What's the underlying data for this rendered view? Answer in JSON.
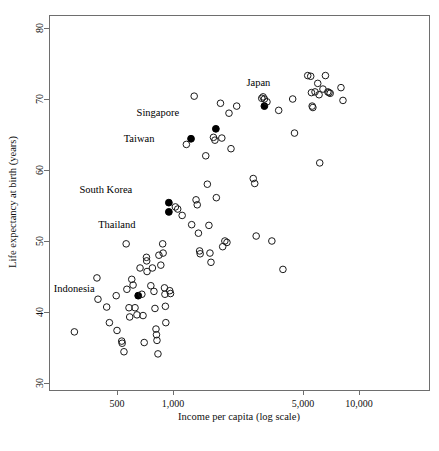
{
  "chart_data": {
    "type": "scatter",
    "title": "",
    "xlabel": "Income per capita (log scale)",
    "ylabel": "Life expectancy at birth (years)",
    "xscale": "log",
    "yscale": "linear",
    "xlim": [
      230,
      26000
    ],
    "ylim": [
      29,
      82
    ],
    "xticks": [
      500,
      1000,
      5000,
      10000
    ],
    "xtick_labels": [
      "500",
      "1,000",
      "5,000",
      "10,000"
    ],
    "yticks": [
      30,
      40,
      50,
      60,
      70,
      80
    ],
    "ytick_labels": [
      "30",
      "40",
      "50",
      "60",
      "70",
      "80"
    ],
    "grid": false,
    "legend": false,
    "marker_open": "open-circle",
    "marker_highlight": "filled-circle",
    "series": [
      {
        "name": "Highlighted countries",
        "marker": "filled-circle",
        "points": [
          {
            "label": "Japan",
            "x": 3100,
            "y": 69.0,
            "label_dx": -6,
            "label_dy": -20
          },
          {
            "label": "Singapore",
            "x": 1700,
            "y": 65.8,
            "label_dx": -58,
            "label_dy": -13
          },
          {
            "label": "Taiwan",
            "x": 1250,
            "y": 64.4,
            "label_dx": -52,
            "label_dy": 3
          },
          {
            "label": "South Korea",
            "x": 950,
            "y": 55.4,
            "label_dx": -63,
            "label_dy": -10
          },
          {
            "label": "Thailand",
            "x": 950,
            "y": 54.1,
            "label_dx": -52,
            "label_dy": 16
          },
          {
            "label": "Indonesia",
            "x": 650,
            "y": 42.3,
            "label_dx": -64,
            "label_dy": -4
          }
        ]
      },
      {
        "name": "Other countries",
        "marker": "open-circle",
        "points": [
          {
            "x": 295,
            "y": 37.2
          },
          {
            "x": 390,
            "y": 44.8
          },
          {
            "x": 395,
            "y": 41.8
          },
          {
            "x": 440,
            "y": 40.7
          },
          {
            "x": 455,
            "y": 38.5
          },
          {
            "x": 495,
            "y": 42.3
          },
          {
            "x": 500,
            "y": 37.4
          },
          {
            "x": 530,
            "y": 35.9
          },
          {
            "x": 533,
            "y": 35.6
          },
          {
            "x": 545,
            "y": 34.4
          },
          {
            "x": 560,
            "y": 49.6
          },
          {
            "x": 565,
            "y": 43.2
          },
          {
            "x": 580,
            "y": 40.6
          },
          {
            "x": 585,
            "y": 39.3
          },
          {
            "x": 600,
            "y": 44.6
          },
          {
            "x": 610,
            "y": 43.8
          },
          {
            "x": 625,
            "y": 40.6
          },
          {
            "x": 640,
            "y": 39.6
          },
          {
            "x": 665,
            "y": 46.2
          },
          {
            "x": 680,
            "y": 42.5
          },
          {
            "x": 690,
            "y": 39.5
          },
          {
            "x": 700,
            "y": 35.7
          },
          {
            "x": 720,
            "y": 47.7
          },
          {
            "x": 722,
            "y": 47.2
          },
          {
            "x": 725,
            "y": 45.7
          },
          {
            "x": 760,
            "y": 43.7
          },
          {
            "x": 775,
            "y": 46.2
          },
          {
            "x": 790,
            "y": 42.9
          },
          {
            "x": 800,
            "y": 40.5
          },
          {
            "x": 810,
            "y": 37.6
          },
          {
            "x": 815,
            "y": 36.8
          },
          {
            "x": 820,
            "y": 36.0
          },
          {
            "x": 830,
            "y": 34.1
          },
          {
            "x": 840,
            "y": 48.0
          },
          {
            "x": 860,
            "y": 46.6
          },
          {
            "x": 880,
            "y": 49.6
          },
          {
            "x": 885,
            "y": 48.3
          },
          {
            "x": 900,
            "y": 43.4
          },
          {
            "x": 905,
            "y": 42.5
          },
          {
            "x": 910,
            "y": 40.8
          },
          {
            "x": 915,
            "y": 38.5
          },
          {
            "x": 960,
            "y": 43.0
          },
          {
            "x": 970,
            "y": 42.6
          },
          {
            "x": 1030,
            "y": 54.8
          },
          {
            "x": 1060,
            "y": 54.5
          },
          {
            "x": 1120,
            "y": 53.6
          },
          {
            "x": 1180,
            "y": 63.6
          },
          {
            "x": 1260,
            "y": 52.3
          },
          {
            "x": 1300,
            "y": 70.4
          },
          {
            "x": 1330,
            "y": 55.8
          },
          {
            "x": 1350,
            "y": 55.1
          },
          {
            "x": 1370,
            "y": 51.1
          },
          {
            "x": 1390,
            "y": 48.6
          },
          {
            "x": 1400,
            "y": 48.2
          },
          {
            "x": 1500,
            "y": 62.0
          },
          {
            "x": 1530,
            "y": 58.0
          },
          {
            "x": 1560,
            "y": 52.2
          },
          {
            "x": 1580,
            "y": 48.3
          },
          {
            "x": 1600,
            "y": 47.0
          },
          {
            "x": 1650,
            "y": 64.6
          },
          {
            "x": 1680,
            "y": 64.2
          },
          {
            "x": 1710,
            "y": 56.1
          },
          {
            "x": 1800,
            "y": 69.4
          },
          {
            "x": 1830,
            "y": 64.5
          },
          {
            "x": 1850,
            "y": 49.2
          },
          {
            "x": 1900,
            "y": 50.0
          },
          {
            "x": 1950,
            "y": 49.8
          },
          {
            "x": 2000,
            "y": 68.0
          },
          {
            "x": 2050,
            "y": 63.0
          },
          {
            "x": 2200,
            "y": 69.0
          },
          {
            "x": 2700,
            "y": 58.8
          },
          {
            "x": 2750,
            "y": 58.1
          },
          {
            "x": 2800,
            "y": 50.7
          },
          {
            "x": 3000,
            "y": 70.1
          },
          {
            "x": 3050,
            "y": 70.3
          },
          {
            "x": 3100,
            "y": 70.0
          },
          {
            "x": 3200,
            "y": 69.6
          },
          {
            "x": 3400,
            "y": 50.0
          },
          {
            "x": 3700,
            "y": 68.4
          },
          {
            "x": 3900,
            "y": 46.0
          },
          {
            "x": 4400,
            "y": 70.0
          },
          {
            "x": 4500,
            "y": 65.2
          },
          {
            "x": 5300,
            "y": 73.3
          },
          {
            "x": 5500,
            "y": 73.2
          },
          {
            "x": 5550,
            "y": 70.9
          },
          {
            "x": 5600,
            "y": 69.0
          },
          {
            "x": 5650,
            "y": 68.8
          },
          {
            "x": 5800,
            "y": 71.0
          },
          {
            "x": 6000,
            "y": 72.2
          },
          {
            "x": 6100,
            "y": 70.6
          },
          {
            "x": 6150,
            "y": 61.0
          },
          {
            "x": 6400,
            "y": 71.4
          },
          {
            "x": 6600,
            "y": 73.3
          },
          {
            "x": 6800,
            "y": 71.0
          },
          {
            "x": 6900,
            "y": 70.9
          },
          {
            "x": 7000,
            "y": 70.8
          },
          {
            "x": 8000,
            "y": 71.6
          },
          {
            "x": 8200,
            "y": 69.8
          }
        ]
      }
    ]
  },
  "axes": {
    "x_title": "Income per capita (log scale)",
    "y_title": "Life expectancy at birth (years)",
    "x_tick_labels": [
      "500",
      "1,000",
      "5,000",
      "10,000"
    ],
    "y_tick_labels": [
      "30",
      "40",
      "50",
      "60",
      "70",
      "80"
    ]
  },
  "annotations": {
    "japan": "Japan",
    "singapore": "Singapore",
    "taiwan": "Taiwan",
    "south_korea": "South Korea",
    "thailand": "Thailand",
    "indonesia": "Indonesia"
  },
  "colors": {
    "frame": "#6e6e6e",
    "marker_stroke": "#1a1a1a",
    "marker_fill_highlight": "#000000",
    "text": "#111111",
    "background": "#ffffff"
  }
}
